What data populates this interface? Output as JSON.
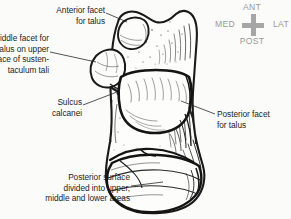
{
  "figure": {
    "background_color": "#fbfbfa",
    "ink_color": "#1d1d1d",
    "compass_color": "#9a9a9a"
  },
  "labels": {
    "anterior_facet": "Anterior facet\nfor talus",
    "middle_facet": "Middle facet for\ntalus on upper\nsurface of susten-\ntaculum tali",
    "sulcus_calcanei": "Sulcus\ncalcanei",
    "posterior_facet": "Posterior facet\nfor talus",
    "posterior_surface": "Posterior surface\ndivided into upper,\nmiddle and lower areas"
  },
  "compass": {
    "anterior": "ANT",
    "posterior": "POST",
    "medial": "MED",
    "lateral": "LAT"
  }
}
